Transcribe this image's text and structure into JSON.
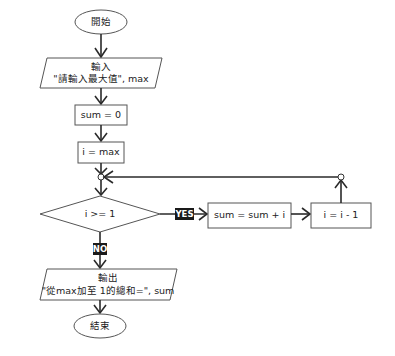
{
  "flowchart": {
    "start": {
      "label": "開始"
    },
    "input": {
      "line1": "輸入",
      "line2": "\"請輸入最大值\", max"
    },
    "assign_sum": {
      "label": "sum = 0"
    },
    "assign_i": {
      "label": "i = max"
    },
    "decision": {
      "label": "i >= 1"
    },
    "yes_label": "YES",
    "no_label": "NO",
    "loop_sum": {
      "label": "sum = sum + i"
    },
    "loop_dec": {
      "label": "i = i - 1"
    },
    "output": {
      "line1": "輸出",
      "line2": "\"從max加至 1的總和=\", sum"
    },
    "end": {
      "label": "結束"
    }
  },
  "colors": {
    "stroke": "#555555",
    "line": "#2a2a2a",
    "label_bg": "#1a1a1a",
    "label_text": "#ffffff",
    "background": "#ffffff"
  }
}
